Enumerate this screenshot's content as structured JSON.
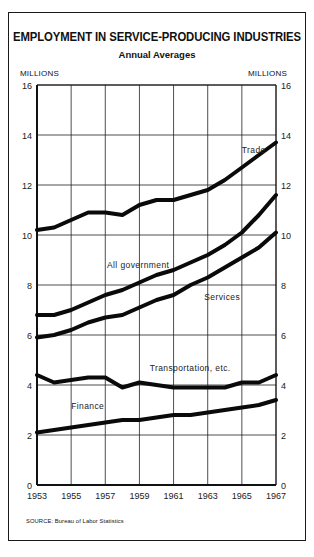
{
  "title": "EMPLOYMENT IN SERVICE-PRODUCING INDUSTRIES",
  "subtitle": "Annual Averages",
  "y_unit_left": "MILLIONS",
  "y_unit_right": "MILLIONS",
  "source": "SOURCE: Bureau of Labor Statistics",
  "chart_data": {
    "type": "line",
    "title": "EMPLOYMENT IN SERVICE-PRODUCING INDUSTRIES",
    "subtitle": "Annual Averages",
    "xlabel": "",
    "ylabel": "MILLIONS",
    "x": [
      1953,
      1954,
      1955,
      1956,
      1957,
      1958,
      1959,
      1960,
      1961,
      1962,
      1963,
      1964,
      1965,
      1966,
      1967
    ],
    "x_ticks": [
      "1953",
      "1955",
      "1957",
      "1959",
      "1961",
      "1963",
      "1965",
      "1967"
    ],
    "y_ticks": [
      "0",
      "2",
      "4",
      "6",
      "8",
      "10",
      "12",
      "14",
      "16"
    ],
    "xlim": [
      1953,
      1967
    ],
    "ylim": [
      0,
      16
    ],
    "grid": true,
    "legend": "inline labels",
    "series": [
      {
        "name": "Trade",
        "label_pos": [
          1965,
          13.3
        ],
        "values": [
          10.2,
          10.3,
          10.6,
          10.9,
          10.9,
          10.8,
          11.2,
          11.4,
          11.4,
          11.6,
          11.8,
          12.2,
          12.7,
          13.2,
          13.7
        ]
      },
      {
        "name": "All government",
        "label_pos": [
          1957.1,
          8.7
        ],
        "values": [
          6.8,
          6.8,
          7.0,
          7.3,
          7.6,
          7.8,
          8.1,
          8.4,
          8.6,
          8.9,
          9.2,
          9.6,
          10.1,
          10.8,
          11.6
        ]
      },
      {
        "name": "Services",
        "label_pos": [
          1962.8,
          7.4
        ],
        "values": [
          5.9,
          6.0,
          6.2,
          6.5,
          6.7,
          6.8,
          7.1,
          7.4,
          7.6,
          8.0,
          8.3,
          8.7,
          9.1,
          9.5,
          10.1
        ]
      },
      {
        "name": "Transportation, etc.",
        "label_pos": [
          1959.6,
          4.55
        ],
        "values": [
          4.4,
          4.1,
          4.2,
          4.3,
          4.3,
          3.9,
          4.1,
          4.0,
          3.9,
          3.9,
          3.9,
          3.9,
          4.1,
          4.1,
          4.4
        ]
      },
      {
        "name": "Finance",
        "label_pos": [
          1955.0,
          3.05
        ],
        "values": [
          2.1,
          2.2,
          2.3,
          2.4,
          2.5,
          2.6,
          2.6,
          2.7,
          2.8,
          2.8,
          2.9,
          3.0,
          3.1,
          3.2,
          3.4
        ]
      }
    ]
  }
}
